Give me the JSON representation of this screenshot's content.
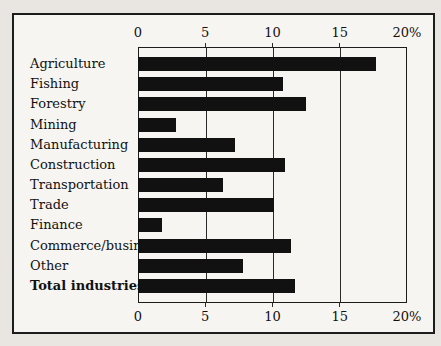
{
  "chart_data": {
    "type": "bar",
    "orientation": "horizontal",
    "title": "",
    "xlabel": "",
    "ylabel": "",
    "unit": "%",
    "categories": [
      "Agriculture",
      "Fishing",
      "Forestry",
      "Mining",
      "Manufacturing",
      "Construction",
      "Transportation",
      "Trade",
      "Finance",
      "Commerce/business",
      "Other",
      "Total industries"
    ],
    "values": [
      17.7,
      10.8,
      12.5,
      2.8,
      7.2,
      10.9,
      6.3,
      10.1,
      1.8,
      11.4,
      7.8,
      11.7
    ],
    "xlim": [
      0,
      20
    ],
    "x_ticks": [
      0,
      5,
      10,
      15,
      20
    ],
    "x_tick_labels": [
      "0",
      "5",
      "10",
      "15",
      "20%"
    ],
    "axis_labels_shown": "top and bottom",
    "grid": true,
    "gridline_ticks": [
      5,
      10,
      15
    ],
    "bold_categories": [
      "Total industries"
    ],
    "legend": "none"
  },
  "colors": {
    "paper": "#e9e6e1",
    "frame_fill": "#f7f5f1",
    "frame_border": "#1c1c1c",
    "bar": "#111111",
    "gridline": "#2a2a2a",
    "text": "#111111"
  }
}
